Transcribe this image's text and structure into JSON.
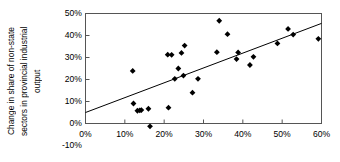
{
  "chart_data": {
    "type": "scatter",
    "title": "",
    "xlabel": "",
    "ylabel": "Change in share of non-state sectors in provincial industrial output",
    "ylabel_lines": [
      "Change in share of non-state",
      "sectors in provincial industrial",
      "output"
    ],
    "xlim": [
      0,
      60
    ],
    "ylim": [
      -10,
      50
    ],
    "grid": false,
    "legend": null,
    "x_tick_labels": [
      "0%",
      "10%",
      "20%",
      "30%",
      "40%",
      "50%",
      "60%"
    ],
    "x_tick_values": [
      0,
      10,
      20,
      30,
      40,
      50,
      60
    ],
    "y_tick_labels": [
      "50%",
      "40%",
      "30%",
      "20%",
      "10%",
      "0%",
      "-10%"
    ],
    "y_tick_values": [
      50,
      40,
      30,
      20,
      10,
      0,
      -10
    ],
    "x_unit": "%",
    "y_unit": "%",
    "marker": "diamond",
    "marker_color": "#000000",
    "points": [
      {
        "x": 12.0,
        "y": 23.9
      },
      {
        "x": 12.2,
        "y": 9.1
      },
      {
        "x": 13.2,
        "y": 5.8
      },
      {
        "x": 13.8,
        "y": 6.0
      },
      {
        "x": 14.2,
        "y": 6.1
      },
      {
        "x": 16.0,
        "y": 6.7
      },
      {
        "x": 16.4,
        "y": -1.3
      },
      {
        "x": 20.9,
        "y": 31.3
      },
      {
        "x": 21.1,
        "y": 7.2
      },
      {
        "x": 21.9,
        "y": 31.2
      },
      {
        "x": 22.7,
        "y": 20.3
      },
      {
        "x": 23.6,
        "y": 25.0
      },
      {
        "x": 24.4,
        "y": 32.1
      },
      {
        "x": 24.9,
        "y": 21.8
      },
      {
        "x": 25.2,
        "y": 35.4
      },
      {
        "x": 27.2,
        "y": 14.0
      },
      {
        "x": 28.6,
        "y": 20.3
      },
      {
        "x": 33.4,
        "y": 32.4
      },
      {
        "x": 34.0,
        "y": 46.7
      },
      {
        "x": 36.1,
        "y": 40.6
      },
      {
        "x": 38.4,
        "y": 29.3
      },
      {
        "x": 38.8,
        "y": 32.3
      },
      {
        "x": 41.8,
        "y": 26.6
      },
      {
        "x": 42.7,
        "y": 30.3
      },
      {
        "x": 48.8,
        "y": 36.4
      },
      {
        "x": 51.5,
        "y": 43.0
      },
      {
        "x": 52.8,
        "y": 40.4
      },
      {
        "x": 59.2,
        "y": 38.5
      }
    ],
    "trendline": {
      "type": "linear",
      "x_start": 0,
      "y_start": 5.0,
      "x_end": 60,
      "y_end": 45.5,
      "color": "#000000"
    },
    "axes": {
      "frame_color": "#555555",
      "zero_line_y": 0
    }
  }
}
